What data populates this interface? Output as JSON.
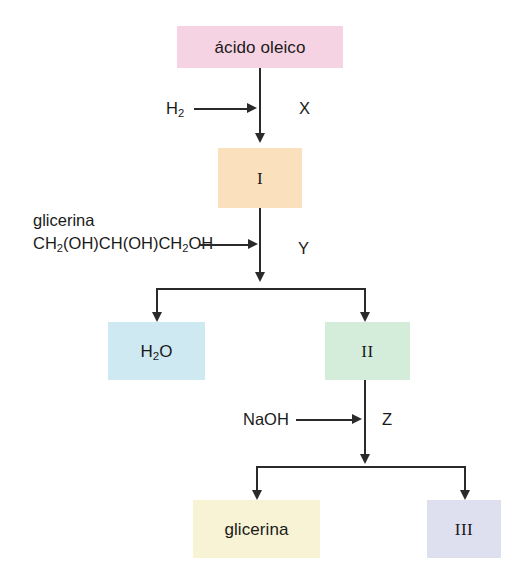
{
  "diagram": {
    "language": "es",
    "background_color": "#ffffff",
    "line_color": "#2a2a2a"
  },
  "boxes": {
    "acido_oleico": {
      "label": "ácido oleico",
      "color": "#f6d3e3"
    },
    "product_I": {
      "label": "I",
      "color": "#fae0bd"
    },
    "water": {
      "label_html": "H<sub>2</sub>O",
      "label": "H2O",
      "color": "#cfe9f3"
    },
    "product_II": {
      "label": "II",
      "color": "#d4edda"
    },
    "glicerina": {
      "label": "glicerina",
      "color": "#f7f3d4"
    },
    "product_III": {
      "label": "III",
      "color": "#dfe0ef"
    }
  },
  "reagents": {
    "hydrogen": {
      "label_html": "H<sub>2</sub>",
      "label": "H2"
    },
    "glicerina_name": {
      "label": "glicerina"
    },
    "glicerina_formula": {
      "label_html": "CH<sub>2</sub>(OH)CH(OH)CH<sub>2</sub>OH",
      "label": "CH2(OH)CH(OH)CH2OH"
    },
    "sodium_hydroxide": {
      "label": "NaOH"
    }
  },
  "step_labels": {
    "step_x": "X",
    "step_y": "Y",
    "step_z": "Z"
  }
}
